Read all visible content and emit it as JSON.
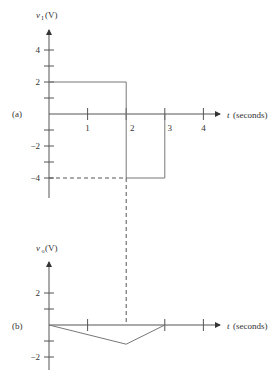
{
  "figure": {
    "panel_a": {
      "label": "(a)",
      "ylabel_main": "v",
      "ylabel_sub": "I",
      "ylabel_unit": "(V)",
      "xlabel_var": "t",
      "xlabel_unit": "(seconds)",
      "x_ticks": [
        1,
        2,
        3,
        4
      ],
      "x_tick_labels": [
        "1",
        "2",
        "3",
        "4"
      ],
      "y_ticks": [
        4,
        3,
        2,
        1,
        -1,
        -2,
        -3,
        -4
      ],
      "y_tick_labels": {
        "4": "4",
        "2": "2",
        "-2": "−2",
        "-4": "−4"
      },
      "signal_points": [
        [
          0,
          2
        ],
        [
          2,
          2
        ],
        [
          2,
          -4
        ],
        [
          3,
          -4
        ],
        [
          3,
          0
        ]
      ],
      "guide_dashed_horizontal": {
        "from_t": 0,
        "to_t": 2,
        "v": -4
      }
    },
    "panel_b": {
      "label": "(b)",
      "ylabel_main": "v",
      "ylabel_sub": "o",
      "ylabel_unit": "(V)",
      "xlabel_var": "t",
      "xlabel_unit": "(seconds)",
      "x_ticks": [
        1,
        2,
        3,
        4
      ],
      "y_ticks": [
        2,
        1,
        -1,
        -2
      ],
      "y_tick_labels": {
        "2": "2",
        "-2": "−2"
      },
      "signal_points": [
        [
          0,
          0
        ],
        [
          2,
          -1.2
        ],
        [
          3,
          0
        ]
      ]
    },
    "guide_dashed_vertical": {
      "t": 2
    }
  }
}
